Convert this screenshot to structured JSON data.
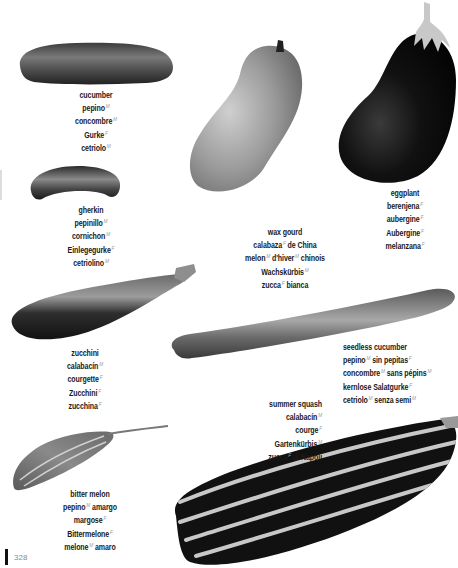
{
  "page": {
    "page_number": "328",
    "colors": {
      "background": "#ffffff",
      "text": "#1a1a1a",
      "gender_marker": "#9a9a9a",
      "folio_bar": "#111111"
    }
  },
  "items": [
    {
      "id": "cucumber",
      "name": "cucumber",
      "translations": [
        {
          "text": "pepino",
          "g": "M"
        },
        {
          "text": "concombre",
          "g": "M"
        },
        {
          "text": "Gurke",
          "g": "F"
        },
        {
          "text": "cetriolo",
          "g": "M"
        }
      ]
    },
    {
      "id": "gherkin",
      "name": "gherkin",
      "translations": [
        {
          "text": "pepinillo",
          "g": "M"
        },
        {
          "text": "cornichon",
          "g": "M"
        },
        {
          "text": "Einlegegurke",
          "g": "F"
        },
        {
          "text": "cetriolino",
          "g": "M"
        }
      ]
    },
    {
      "id": "wax-gourd",
      "name": "wax gourd",
      "translations": [
        {
          "parts": [
            {
              "text": "calabaza",
              "g": "F"
            },
            {
              "text": "de China"
            }
          ]
        },
        {
          "parts": [
            {
              "text": "melon",
              "g": "M"
            },
            {
              "text": "d'hiver",
              "g": "M"
            },
            {
              "text": "chinois"
            }
          ]
        },
        {
          "parts": [
            {
              "text": "Wachskürbis",
              "g": "M"
            }
          ]
        },
        {
          "parts": [
            {
              "text": "zucca",
              "g": "F"
            },
            {
              "text": "bianca"
            }
          ]
        }
      ]
    },
    {
      "id": "eggplant",
      "name": "eggplant",
      "translations": [
        {
          "text": "berenjena",
          "g": "F"
        },
        {
          "text": "aubergine",
          "g": "F"
        },
        {
          "text": "Aubergine",
          "g": "F"
        },
        {
          "text": "melanzana",
          "g": "F"
        }
      ]
    },
    {
      "id": "zucchini",
      "name": "zucchini",
      "translations": [
        {
          "text": "calabacín",
          "g": "M"
        },
        {
          "text": "courgette",
          "g": "F"
        },
        {
          "text": "Zucchini",
          "g": "F"
        },
        {
          "text": "zucchina",
          "g": "F"
        }
      ]
    },
    {
      "id": "seedless-cucumber",
      "name": "seedless cucumber",
      "translations": [
        {
          "parts": [
            {
              "text": "pepino",
              "g": "M"
            },
            {
              "text": "sin pepitas",
              "g": "F"
            }
          ]
        },
        {
          "parts": [
            {
              "text": "concombre",
              "g": "M"
            },
            {
              "text": "sans pépins",
              "g": "M"
            }
          ]
        },
        {
          "parts": [
            {
              "text": "kernlose Salatgurke",
              "g": "F"
            }
          ]
        },
        {
          "parts": [
            {
              "text": "cetriolo",
              "g": "M"
            },
            {
              "text": "senza semi",
              "g": "M"
            }
          ]
        }
      ]
    },
    {
      "id": "summer-squash",
      "name": "summer squash",
      "translations": [
        {
          "parts": [
            {
              "text": "calabacín",
              "g": "M"
            }
          ]
        },
        {
          "parts": [
            {
              "text": "courge",
              "g": "F"
            }
          ]
        },
        {
          "parts": [
            {
              "text": "Gartenkürbis",
              "g": "M"
            }
          ]
        },
        {
          "parts": [
            {
              "text": "zucca",
              "g": "F"
            },
            {
              "text": "di Napoli"
            }
          ]
        }
      ]
    },
    {
      "id": "bitter-melon",
      "name": "bitter melon",
      "translations": [
        {
          "parts": [
            {
              "text": "pepino",
              "g": "M"
            },
            {
              "text": "amargo"
            }
          ]
        },
        {
          "parts": [
            {
              "text": "margose",
              "g": "F"
            }
          ]
        },
        {
          "parts": [
            {
              "text": "Bittermelone",
              "g": "F"
            }
          ]
        },
        {
          "parts": [
            {
              "text": "melone",
              "g": "M"
            },
            {
              "text": "amaro"
            }
          ]
        }
      ]
    }
  ]
}
